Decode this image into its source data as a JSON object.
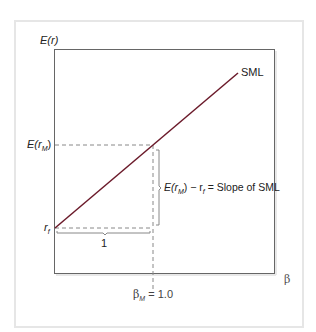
{
  "diagram": {
    "y_axis_label": "E(r)",
    "x_axis_label": "β",
    "line_label": "SML",
    "expected_market_return_label": "E(r",
    "expected_market_return_sub": "M",
    "risk_free_label": "r",
    "risk_free_sub": "f",
    "run_label": "1",
    "slope_annotation_prefix": "E(r",
    "slope_annotation_sub1": "M",
    "slope_annotation_mid": ") − r",
    "slope_annotation_sub2": "f",
    "slope_annotation_suffix": " = Slope of SML",
    "beta_market_prefix": "β",
    "beta_market_sub": "M",
    "beta_market_value": " = 1.0",
    "colors": {
      "line": "#6b1a2a",
      "axis": "#555555",
      "dashed": "#888888",
      "frame": "#e6e6e6"
    }
  }
}
